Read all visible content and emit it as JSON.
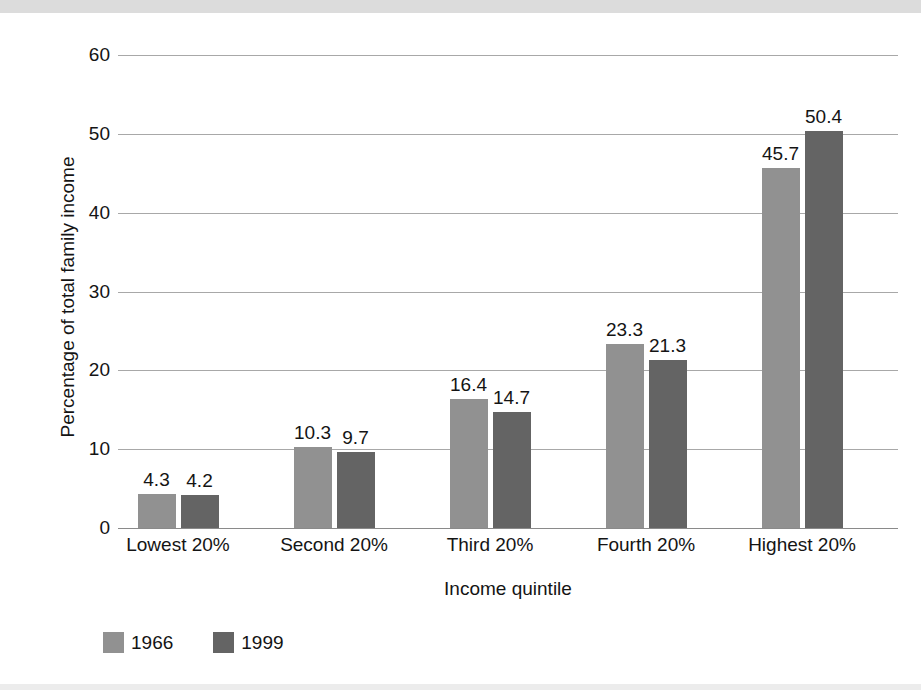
{
  "chart_data": {
    "type": "bar",
    "title": "",
    "subtitle": "",
    "xlabel": "Income quintile",
    "ylabel": "Percentage of total family income",
    "categories": [
      "Lowest 20%",
      "Second 20%",
      "Third 20%",
      "Fourth 20%",
      "Highest 20%"
    ],
    "series": [
      {
        "name": "1966",
        "color": "#919191",
        "values": [
          4.3,
          10.3,
          16.4,
          23.3,
          45.7
        ],
        "labels": [
          "4.3",
          "10.3",
          "16.4",
          "23.3",
          "45.7"
        ]
      },
      {
        "name": "1999",
        "color": "#646464",
        "values": [
          4.2,
          9.7,
          14.7,
          21.3,
          50.4
        ],
        "labels": [
          "4.2",
          "9.7",
          "14.7",
          "21.3",
          "50.4"
        ]
      }
    ],
    "ylim": [
      0,
      60
    ],
    "yticks": [
      0,
      10,
      20,
      30,
      40,
      50,
      60
    ],
    "ytick_labels": [
      "0",
      "10",
      "20",
      "30",
      "40",
      "50",
      "60"
    ],
    "grid": true,
    "legend_position": "bottom-left",
    "value_labels_shown": true
  },
  "legend": {
    "items": [
      {
        "label": "1966",
        "color": "#919191"
      },
      {
        "label": "1999",
        "color": "#646464"
      }
    ]
  },
  "colors": {
    "series_1966": "#919191",
    "series_1999": "#646464",
    "gridline": "#a8a8a8",
    "axis_text": "#141414",
    "top_band": "#dcdcdc",
    "background": "#ffffff"
  }
}
